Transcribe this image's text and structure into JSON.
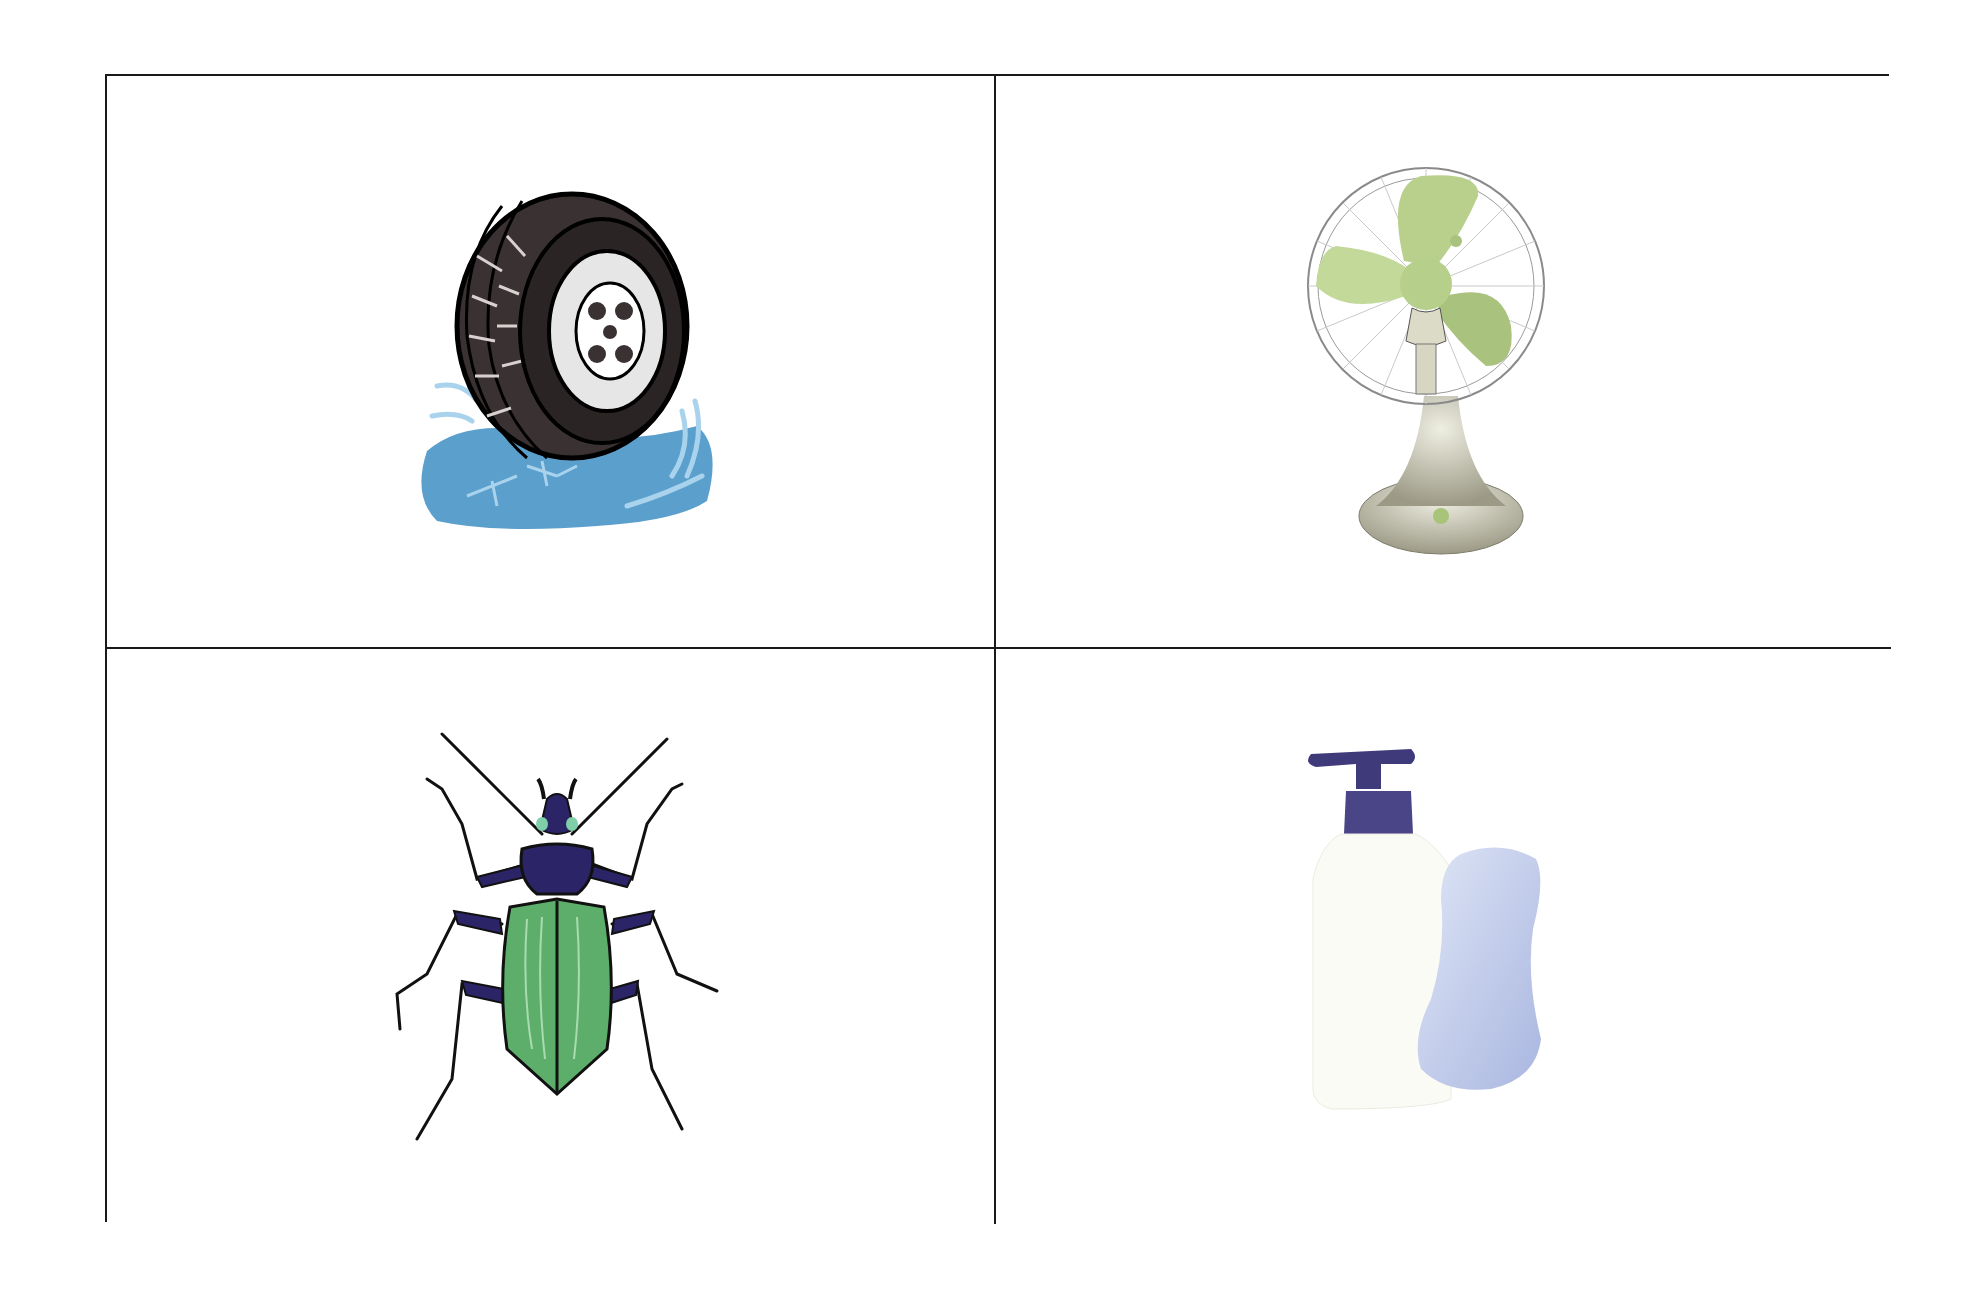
{
  "page": {
    "background": "#ffffff",
    "grid_line_color": "#1a1a1a"
  },
  "cards": [
    {
      "id": "tire",
      "label": "Tire in puddle",
      "icon": "tire-icon",
      "colors": {
        "rubber": "#3a3232",
        "hub": "#e6e6e6",
        "water": "#5b9fcc",
        "splash": "#a9d3ec"
      }
    },
    {
      "id": "fan",
      "label": "Electric desk fan",
      "icon": "fan-icon",
      "colors": {
        "blades": "#b8d08c",
        "guard": "#8a8a8a",
        "body": "#c9c8b8"
      }
    },
    {
      "id": "beetle",
      "label": "Green beetle",
      "icon": "beetle-icon",
      "colors": {
        "shell": "#5cae6a",
        "body": "#2b2466",
        "outline": "#111111"
      }
    },
    {
      "id": "soap",
      "label": "Soap pump bottle and soap bar",
      "icon": "soap-icon",
      "colors": {
        "bottle": "#fbfbf6",
        "pump": "#3f3a7a",
        "bar": "#c3cdea"
      }
    }
  ]
}
